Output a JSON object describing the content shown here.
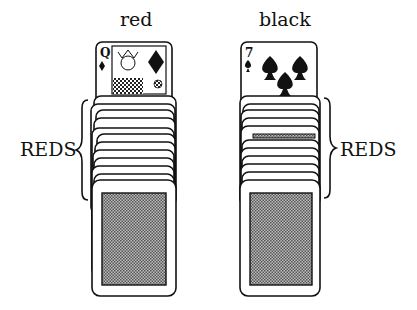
{
  "piles": [
    {
      "title": "red",
      "top_card": {
        "rank": "Q",
        "suit": "diamond",
        "face": "queen"
      },
      "bracket_label": "REDS",
      "bracket_side": "left"
    },
    {
      "title": "black",
      "top_card": {
        "rank": "7",
        "suit": "spade"
      },
      "bracket_label": "REDS",
      "bracket_side": "right"
    }
  ],
  "colors": {
    "ink": "#111111",
    "back_pattern": "#8a8a8a",
    "paper": "#ffffff"
  }
}
